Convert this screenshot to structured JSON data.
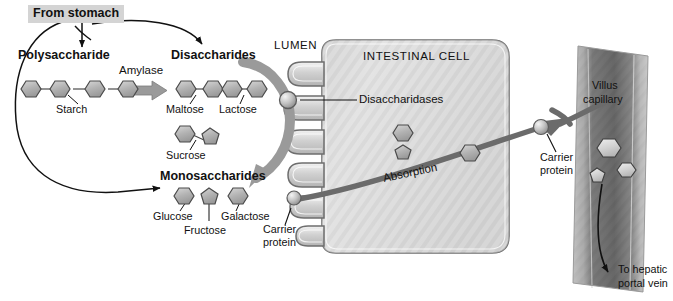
{
  "diagram": {
    "title_labels": {
      "from_stomach": "From stomach",
      "polysaccharide": "Polysaccharide",
      "disaccharides": "Disaccharides",
      "monosaccharides": "Monosaccharides",
      "lumen": "LUMEN",
      "intestinal_cell": "INTESTINAL CELL"
    },
    "enzymes": {
      "amylase": "Amylase",
      "disaccharidases": "Disaccharidases"
    },
    "molecules": {
      "starch": "Starch",
      "maltose": "Maltose",
      "lactose": "Lactose",
      "sucrose": "Sucrose",
      "glucose": "Glucose",
      "fructose": "Fructose",
      "galactose": "Galactose"
    },
    "transport": {
      "carrier_protein_left": "Carrier\nprotein",
      "carrier_protein_left_line1": "Carrier",
      "carrier_protein_left_line2": "protein",
      "carrier_protein_right_line1": "Carrier",
      "carrier_protein_right_line2": "protein",
      "absorption": "Absorption",
      "villus_capillary_line1": "Villus",
      "villus_capillary_line2": "capillary",
      "to_hepatic_line1": "To hepatic",
      "to_hepatic_line2": "portal vein"
    },
    "colors": {
      "ink": "#111111",
      "label_box_bg": "#d4d4d4",
      "big_arrow_gray": "#9a9a9a",
      "cell_fill": "#dcdcdc",
      "cell_stroke": "#6e6e6e",
      "capillary_dark": "#6f6f6f",
      "capillary_light": "#cfcfcf",
      "sugar_fill": "#b8b8b8",
      "sugar_stroke": "#4a4a4a"
    },
    "shapes": {
      "starch_units": [
        "hexagon",
        "hexagon",
        "hexagon",
        "hexagon"
      ],
      "maltose_units": [
        "hexagon",
        "hexagon"
      ],
      "lactose_units": [
        "hexagon",
        "hexagon"
      ],
      "sucrose_units": [
        "hexagon",
        "pentagon"
      ],
      "monosaccharide_units": [
        "hexagon",
        "pentagon",
        "hexagon"
      ],
      "cell_interior_units": [
        "pentagon",
        "hexagon",
        "hexagon"
      ],
      "capillary_units": [
        "hexagon",
        "pentagon",
        "hexagon"
      ],
      "microvilli_count": 6
    }
  }
}
